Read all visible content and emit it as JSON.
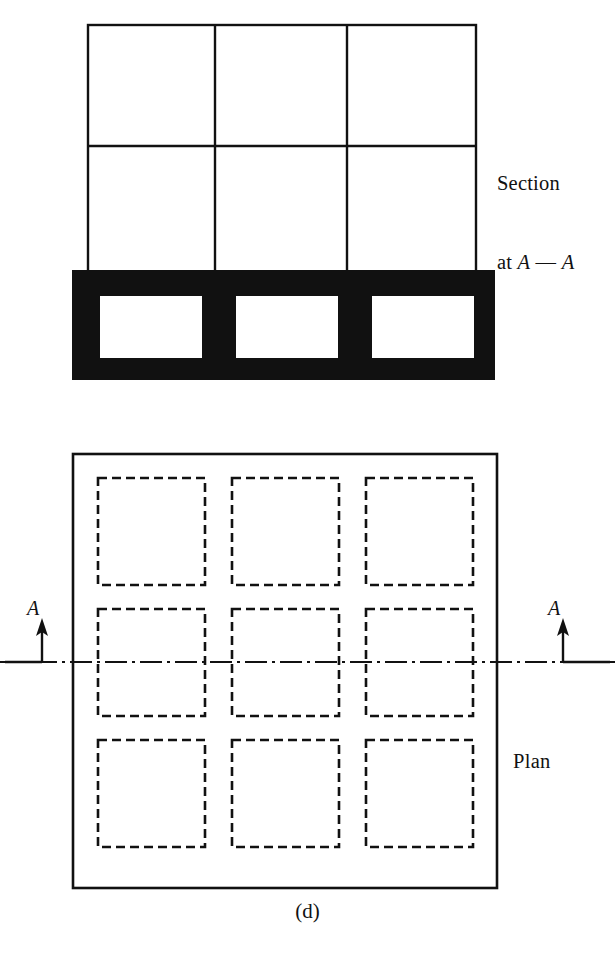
{
  "figure": {
    "caption": "(d)",
    "section_label_line1": "Section",
    "section_label_line2_prefix": "at ",
    "section_label_letter_a": "A",
    "section_label_dash": " — ",
    "section_label_letter_b": "A",
    "plan_label": "Plan",
    "section_marker_left": "A",
    "section_marker_right": "A"
  },
  "colors": {
    "line": "#111111",
    "fill_solid": "#111111",
    "background": "#ffffff",
    "void_fill": "#ffffff"
  },
  "section_view": {
    "grid": {
      "x_left": 88,
      "x_right": 476,
      "y_top": 25,
      "y_bottom": 272,
      "column_lines": [
        215,
        347
      ],
      "row_lines": [
        146
      ],
      "columns": 3,
      "rows": 2,
      "stroke_width": 2.4
    },
    "footing_band": {
      "x": 72,
      "y": 270,
      "width": 423,
      "height": 110
    },
    "voids": [
      {
        "x": 100,
        "y": 296,
        "width": 102,
        "height": 62
      },
      {
        "x": 236,
        "y": 296,
        "width": 102,
        "height": 62
      },
      {
        "x": 372,
        "y": 296,
        "width": 102,
        "height": 62
      }
    ]
  },
  "plan_view": {
    "outline": {
      "x": 73,
      "y": 454,
      "width": 424,
      "height": 434,
      "stroke_width": 2.6
    },
    "hidden_squares": [
      {
        "x": 98,
        "y": 478,
        "width": 107,
        "height": 107
      },
      {
        "x": 232,
        "y": 478,
        "width": 107,
        "height": 107
      },
      {
        "x": 366,
        "y": 478,
        "width": 107,
        "height": 107
      },
      {
        "x": 98,
        "y": 609,
        "width": 107,
        "height": 107
      },
      {
        "x": 232,
        "y": 609,
        "width": 107,
        "height": 107
      },
      {
        "x": 366,
        "y": 609,
        "width": 107,
        "height": 107
      },
      {
        "x": 98,
        "y": 740,
        "width": 107,
        "height": 107
      },
      {
        "x": 232,
        "y": 740,
        "width": 107,
        "height": 107
      },
      {
        "x": 366,
        "y": 740,
        "width": 107,
        "height": 107
      }
    ],
    "hidden_dash_pattern": "9 5",
    "hidden_stroke_width": 2.6,
    "centerline": {
      "y": 662,
      "x_start": 0,
      "x_end": 615,
      "dash_pattern": "22 5 3 5",
      "stroke_width": 2.0
    },
    "section_markers": [
      {
        "side": "left",
        "leader_x": 42,
        "leader_y": 662,
        "leader_x_end": 5,
        "arrow_tip_y": 618,
        "letter": "A"
      },
      {
        "side": "right",
        "leader_x": 563,
        "leader_y": 662,
        "leader_x_end": 610,
        "arrow_tip_y": 618,
        "letter": "A"
      }
    ]
  }
}
